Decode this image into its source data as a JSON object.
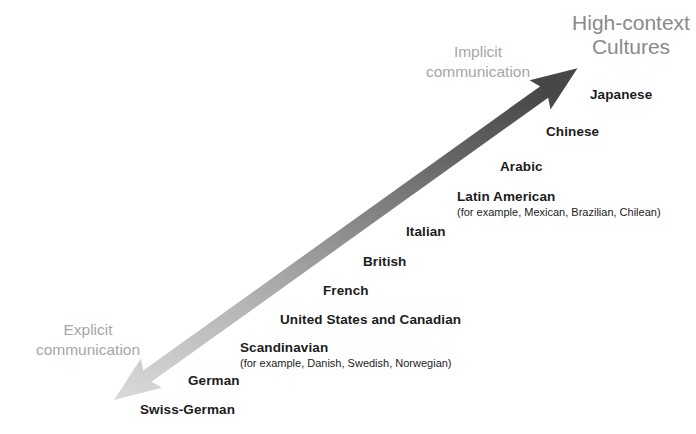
{
  "diagram": {
    "title": {
      "line1": "High-context",
      "line2": "Cultures"
    },
    "poles": {
      "implicit": {
        "line1": "Implicit",
        "line2": "communication"
      },
      "explicit": {
        "line1": "Explicit",
        "line2": "communication"
      }
    },
    "arrow": {
      "start_color": "#f2f2f2",
      "mid_color": "#b4b4b4",
      "end_color": "#4a4a4a",
      "direction": "bidirectional-diagonal"
    },
    "cultures": [
      {
        "name": "Japanese",
        "note": ""
      },
      {
        "name": "Chinese",
        "note": ""
      },
      {
        "name": "Arabic",
        "note": ""
      },
      {
        "name": "Latin American",
        "note": "(for example, Mexican, Brazilian, Chilean)"
      },
      {
        "name": "Italian",
        "note": ""
      },
      {
        "name": "British",
        "note": ""
      },
      {
        "name": "French",
        "note": ""
      },
      {
        "name": "United States and Canadian",
        "note": ""
      },
      {
        "name": "Scandinavian",
        "note": "(for example, Danish, Swedish, Norwegian)"
      },
      {
        "name": "German",
        "note": ""
      },
      {
        "name": "Swiss-German",
        "note": ""
      }
    ]
  }
}
